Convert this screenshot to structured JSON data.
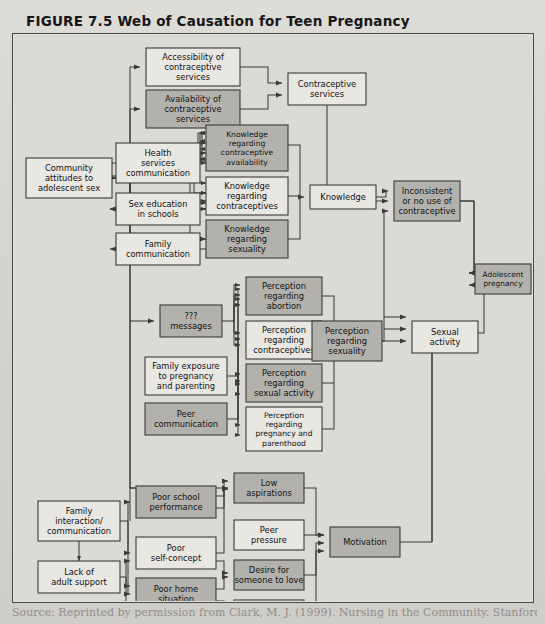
{
  "figure": {
    "title": "FIGURE 7.5 Web of Causation for Teen Pregnancy",
    "source": "Source: Reprinted by permission from Clark, M. J. (1999). Nursing in the Community. Stanford, CT:"
  },
  "legend": {
    "shaded_fill": "#b3b1ac",
    "plain_fill": "#e9e7e2",
    "line_color": "#3b3b3b",
    "panel_bg": "#dcdad5"
  },
  "chart_data": {
    "type": "diagram",
    "title": "Web of Causation for Teen Pregnancy",
    "nodes": [
      {
        "id": "community",
        "label": "Community\nattitudes to\nadolescent sex",
        "x": 14,
        "y": 125,
        "w": 86,
        "h": 40,
        "shaded": false
      },
      {
        "id": "accessibility",
        "label": "Accessibility of\ncontraceptive\nservices",
        "x": 134,
        "y": 15,
        "w": 94,
        "h": 38,
        "shaded": false
      },
      {
        "id": "availability",
        "label": "Availability of\ncontraceptive\nservices",
        "x": 134,
        "y": 57,
        "w": 94,
        "h": 38,
        "shaded": true
      },
      {
        "id": "contraceptive_services",
        "label": "Contraceptive\nservices",
        "x": 276,
        "y": 40,
        "w": 78,
        "h": 32,
        "shaded": false
      },
      {
        "id": "health_services",
        "label": "Health\nservices\ncommunication",
        "x": 104,
        "y": 110,
        "w": 84,
        "h": 40,
        "shaded": false
      },
      {
        "id": "sex_education",
        "label": "Sex education\nin schools",
        "x": 104,
        "y": 160,
        "w": 84,
        "h": 32,
        "shaded": false
      },
      {
        "id": "family_comm",
        "label": "Family\ncommunication",
        "x": 104,
        "y": 200,
        "w": 84,
        "h": 32,
        "shaded": false
      },
      {
        "id": "know_avail",
        "label": "Knowledge\nregarding\ncontraceptive\navailability",
        "x": 194,
        "y": 92,
        "w": 82,
        "h": 46,
        "shaded": true
      },
      {
        "id": "know_contra",
        "label": "Knowledge\nregarding\ncontraceptives",
        "x": 194,
        "y": 144,
        "w": 82,
        "h": 38,
        "shaded": false
      },
      {
        "id": "know_sex",
        "label": "Knowledge\nregarding\nsexuality",
        "x": 194,
        "y": 187,
        "w": 82,
        "h": 38,
        "shaded": true
      },
      {
        "id": "knowledge",
        "label": "Knowledge",
        "x": 298,
        "y": 152,
        "w": 66,
        "h": 24,
        "shaded": false
      },
      {
        "id": "inconsistent",
        "label": "Inconsistent\nor no use of\ncontraceptive",
        "x": 382,
        "y": 148,
        "w": 66,
        "h": 40,
        "shaded": true
      },
      {
        "id": "adolescent_preg",
        "label": "Adolescent\npregnancy",
        "x": 463,
        "y": 231,
        "w": 56,
        "h": 30,
        "shaded": true
      },
      {
        "id": "media_messages",
        "label": "???\nmessages",
        "x": 148,
        "y": 272,
        "w": 62,
        "h": 32,
        "shaded": true
      },
      {
        "id": "family_exposure",
        "label": "Family exposure\nto pregnancy\nand parenting",
        "x": 133,
        "y": 324,
        "w": 82,
        "h": 38,
        "shaded": false
      },
      {
        "id": "peer_comm",
        "label": "Peer\ncommunication",
        "x": 133,
        "y": 370,
        "w": 82,
        "h": 32,
        "shaded": true
      },
      {
        "id": "perc_abortion",
        "label": "Perception\nregarding\nabortion",
        "x": 234,
        "y": 244,
        "w": 76,
        "h": 38,
        "shaded": true
      },
      {
        "id": "perc_contra",
        "label": "Perception\nregarding\ncontraceptives",
        "x": 234,
        "y": 288,
        "w": 76,
        "h": 38,
        "shaded": false
      },
      {
        "id": "perc_sexact",
        "label": "Perception\nregarding\nsexual activity",
        "x": 234,
        "y": 331,
        "w": 76,
        "h": 38,
        "shaded": true
      },
      {
        "id": "perc_pregpar",
        "label": "Perception\nregarding\npregnancy and\nparenthood",
        "x": 234,
        "y": 374,
        "w": 76,
        "h": 44,
        "shaded": false
      },
      {
        "id": "perc_sexuality",
        "label": "Perception\nregarding\nsexuality",
        "x": 300,
        "y": 288,
        "w": 70,
        "h": 40,
        "shaded": true
      },
      {
        "id": "sexual_activity",
        "label": "Sexual\nactivity",
        "x": 400,
        "y": 288,
        "w": 66,
        "h": 32,
        "shaded": false
      },
      {
        "id": "family_inter",
        "label": "Family\ninteraction/\ncommunication",
        "x": 26,
        "y": 468,
        "w": 82,
        "h": 40,
        "shaded": false
      },
      {
        "id": "lack_support",
        "label": "Lack of\nadult support",
        "x": 26,
        "y": 528,
        "w": 82,
        "h": 32,
        "shaded": false
      },
      {
        "id": "poor_school",
        "label": "Poor school\nperformance",
        "x": 124,
        "y": 453,
        "w": 80,
        "h": 32,
        "shaded": true
      },
      {
        "id": "poor_self",
        "label": "Poor\nself-concept",
        "x": 124,
        "y": 504,
        "w": 80,
        "h": 32,
        "shaded": false
      },
      {
        "id": "poor_home",
        "label": "Poor home\nsituation",
        "x": 124,
        "y": 545,
        "w": 80,
        "h": 32,
        "shaded": true
      },
      {
        "id": "low_asp",
        "label": "Low\naspirations",
        "x": 222,
        "y": 440,
        "w": 70,
        "h": 30,
        "shaded": true
      },
      {
        "id": "peer_pressure",
        "label": "Peer\npressure",
        "x": 222,
        "y": 487,
        "w": 70,
        "h": 30,
        "shaded": false
      },
      {
        "id": "desire_love",
        "label": "Desire for\nsomeone to love",
        "x": 222,
        "y": 527,
        "w": 70,
        "h": 30,
        "shaded": true
      },
      {
        "id": "desire_away",
        "label": "Desire to\nget away",
        "x": 222,
        "y": 567,
        "w": 70,
        "h": 30,
        "shaded": false
      },
      {
        "id": "motivation",
        "label": "Motivation",
        "x": 318,
        "y": 494,
        "w": 70,
        "h": 30,
        "shaded": true
      }
    ],
    "edges": [
      "community -> accessibility",
      "community -> availability",
      "community -> health_services",
      "community -> sex_education",
      "community -> family_comm",
      "community -> media_messages",
      "accessibility -> contraceptive_services",
      "availability -> contraceptive_services",
      "health_services -> know_avail",
      "health_services -> know_contra",
      "health_services -> know_sex",
      "sex_education -> know_avail",
      "sex_education -> know_contra",
      "sex_education -> know_sex",
      "family_comm -> know_avail",
      "family_comm -> know_contra",
      "family_comm -> know_sex",
      "know_avail -> knowledge",
      "know_contra -> knowledge",
      "know_sex -> knowledge",
      "knowledge -> inconsistent",
      "contraceptive_services -> inconsistent",
      "inconsistent -> adolescent_preg",
      "sexual_activity -> adolescent_preg",
      "media_messages -> perc_abortion",
      "media_messages -> perc_contra",
      "media_messages -> perc_sexact",
      "media_messages -> perc_pregpar",
      "family_exposure -> perc_abortion",
      "family_exposure -> perc_contra",
      "family_exposure -> perc_sexact",
      "family_exposure -> perc_pregpar",
      "peer_comm -> perc_abortion",
      "peer_comm -> perc_contra",
      "peer_comm -> perc_sexact",
      "peer_comm -> perc_pregpar",
      "perc_abortion -> perc_sexuality",
      "perc_contra -> perc_sexuality",
      "perc_sexact -> perc_sexuality",
      "perc_pregpar -> perc_sexuality",
      "perc_sexuality -> sexual_activity",
      "perc_sexuality -> inconsistent",
      "motivation -> sexual_activity",
      "family_inter <-> lack_support",
      "family_inter -> poor_school",
      "family_inter -> poor_self",
      "family_inter -> poor_home",
      "lack_support -> poor_self",
      "lack_support -> poor_home",
      "lack_support -> desire_love",
      "poor_school -> low_asp",
      "poor_self -> low_asp",
      "poor_self -> desire_love",
      "poor_home -> desire_love",
      "poor_home -> desire_away",
      "low_asp -> motivation",
      "peer_pressure -> motivation",
      "desire_love -> motivation",
      "desire_away -> motivation",
      "community -> low_asp"
    ]
  }
}
